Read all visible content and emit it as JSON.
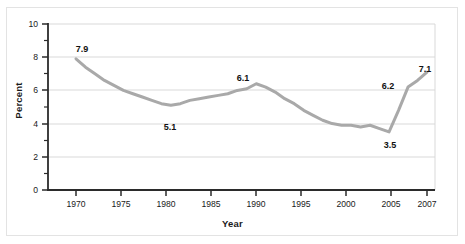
{
  "figure": {
    "background_color": "#ffffff",
    "frame_color": "#e3e3e3"
  },
  "chart_data": {
    "type": "line",
    "title": "",
    "subtitle": "",
    "xlabel": "Year",
    "ylabel": "Percent",
    "xlim": [
      1967,
      2008
    ],
    "ylim": [
      0,
      10
    ],
    "grid": true,
    "grid_axis": "y",
    "legend": false,
    "legend_position": "none",
    "line_color": "#a9a9a9",
    "line_width": 3,
    "x_ticks": [
      1970,
      1975,
      1980,
      1985,
      1990,
      1995,
      2000,
      2005,
      2007
    ],
    "x_ticklabels": [
      "1970",
      "1975",
      "1980",
      "1985",
      "1990",
      "1995",
      "2000",
      "2005",
      "2007"
    ],
    "y_ticks": [
      0,
      2,
      4,
      6,
      8,
      10
    ],
    "y_ticklabels": [
      "0",
      "2",
      "4",
      "6",
      "8",
      "10"
    ],
    "y_minor_ticks": [
      1,
      3,
      5,
      7,
      9
    ],
    "series": [
      {
        "name": "Percent",
        "x": [
          1970,
          1971,
          1972,
          1973,
          1974,
          1975,
          1976,
          1977,
          1978,
          1979,
          1980,
          1981,
          1982,
          1983,
          1984,
          1985,
          1986,
          1987,
          1988,
          1989,
          1990,
          1991,
          1992,
          1993,
          1994,
          1995,
          1996,
          1997,
          1998,
          1999,
          2000,
          2001,
          2002,
          2003,
          2004,
          2005,
          2006,
          2007
        ],
        "values": [
          7.9,
          7.4,
          7.0,
          6.6,
          6.3,
          6.0,
          5.8,
          5.6,
          5.4,
          5.2,
          5.1,
          5.2,
          5.4,
          5.5,
          5.6,
          5.7,
          5.8,
          6.0,
          6.1,
          6.4,
          6.2,
          5.9,
          5.5,
          5.2,
          4.8,
          4.5,
          4.2,
          4.0,
          3.9,
          3.9,
          3.8,
          3.9,
          3.7,
          3.5,
          4.8,
          6.2,
          6.6,
          7.1
        ]
      }
    ],
    "annotations": [
      {
        "label": "7.9",
        "x": 1970,
        "y": 7.9,
        "position": "above"
      },
      {
        "label": "5.1",
        "x": 1980,
        "y": 5.1,
        "position": "below"
      },
      {
        "label": "6.1",
        "x": 1988,
        "y": 6.1,
        "position": "above"
      },
      {
        "label": "3.5",
        "x": 2003,
        "y": 3.5,
        "position": "below"
      },
      {
        "label": "6.2",
        "x": 2005,
        "y": 6.2,
        "position": "above-left"
      },
      {
        "label": "7.1",
        "x": 2007,
        "y": 7.1,
        "position": "above-left"
      }
    ]
  }
}
